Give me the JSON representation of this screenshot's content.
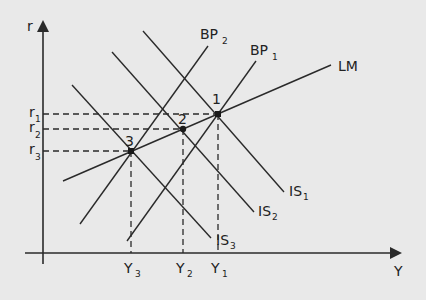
{
  "diagram": {
    "colors": {
      "background": "#e9e9e9",
      "line": "#2a2a2a"
    },
    "axes": {
      "y_label": "r",
      "x_label": "Y"
    },
    "curves": {
      "lm": {
        "label": "LM"
      },
      "bp1": {
        "label": "BP",
        "sub": "1"
      },
      "bp2": {
        "label": "BP",
        "sub": "2"
      },
      "is1": {
        "label": "IS",
        "sub": "1"
      },
      "is2": {
        "label": "IS",
        "sub": "2"
      },
      "is3": {
        "label": "IS",
        "sub": "3"
      }
    },
    "points": [
      {
        "label": "1",
        "r_label": "r",
        "r_sub": "1",
        "y_label": "Y",
        "y_sub": "1"
      },
      {
        "label": "2",
        "r_label": "r",
        "r_sub": "2",
        "y_label": "Y",
        "y_sub": "2"
      },
      {
        "label": "3",
        "r_label": "r",
        "r_sub": "3",
        "y_label": "Y",
        "y_sub": "3"
      }
    ]
  }
}
